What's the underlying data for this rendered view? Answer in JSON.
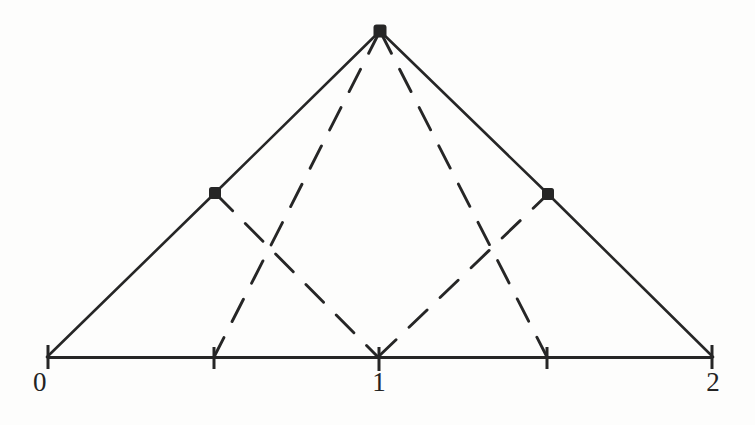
{
  "figure": {
    "title": "",
    "background_color": "#fdfdfc",
    "ink_color": "#262626"
  },
  "axis": {
    "name": "horizontal-number-line",
    "y_pixel": 357,
    "x_start_pixel": 47,
    "x_end_pixel": 713,
    "domain": [
      0,
      2
    ],
    "labels": [
      {
        "text": "0",
        "value": 0,
        "x_pixel": 47,
        "shown": true
      },
      {
        "text": "1",
        "value": 1,
        "x_pixel": 378,
        "shown": true
      },
      {
        "text": "2",
        "value": 2,
        "x_pixel": 713,
        "shown": true
      }
    ],
    "ticks": [
      {
        "value": 0,
        "x_pixel": 47,
        "labeled": true
      },
      {
        "value": 0.5,
        "x_pixel": 214,
        "labeled": false
      },
      {
        "value": 1,
        "x_pixel": 378,
        "labeled": true
      },
      {
        "value": 1.5,
        "x_pixel": 547,
        "labeled": false
      },
      {
        "value": 2,
        "x_pixel": 713,
        "labeled": true
      }
    ]
  },
  "chart_data": {
    "type": "line",
    "title": "",
    "xlabel": "",
    "ylabel": "",
    "xlim": [
      0,
      2
    ],
    "ylim": [
      0,
      1
    ],
    "grid": false,
    "legend": null,
    "x_tick_values": [
      0,
      0.5,
      1,
      1.5,
      2
    ],
    "x_tick_labels": [
      "0",
      "",
      "1",
      "",
      "2"
    ],
    "series": [
      {
        "name": "solid-hat-function",
        "style": "solid",
        "color": "#262626",
        "x": [
          0,
          0.5,
          1,
          1.5,
          2
        ],
        "y": [
          0,
          0.5,
          1,
          0.5,
          0
        ],
        "points_px": [
          [
            47,
            357
          ],
          [
            215,
            193
          ],
          [
            380,
            31
          ],
          [
            548,
            194
          ],
          [
            713,
            357
          ]
        ]
      },
      {
        "name": "dashed-hat-left",
        "style": "dashed",
        "color": "#262626",
        "x": [
          0.5,
          1
        ],
        "y": [
          1,
          0
        ],
        "points_px": [
          [
            380,
            31
          ],
          [
            214,
            357
          ]
        ]
      },
      {
        "name": "dashed-hat-right",
        "style": "dashed",
        "color": "#262626",
        "x": [
          1,
          1.5
        ],
        "y": [
          0,
          1
        ],
        "points_px": [
          [
            380,
            31
          ],
          [
            547,
            357
          ]
        ]
      },
      {
        "name": "dashed-descend-left",
        "style": "dashed",
        "color": "#262626",
        "x": [
          0.5,
          1
        ],
        "y": [
          0.5,
          0
        ],
        "points_px": [
          [
            215,
            193
          ],
          [
            378,
            357
          ]
        ]
      },
      {
        "name": "dashed-descend-right",
        "style": "dashed",
        "color": "#262626",
        "x": [
          1,
          1.5
        ],
        "y": [
          0,
          0.5
        ],
        "points_px": [
          [
            378,
            357
          ],
          [
            548,
            194
          ]
        ]
      }
    ],
    "markers": [
      {
        "name": "node-left",
        "x": 0.5,
        "y": 0.5,
        "x_pixel": 215,
        "y_pixel": 193,
        "shape": "filled-square-dot"
      },
      {
        "name": "node-apex",
        "x": 1.0,
        "y": 1.0,
        "x_pixel": 380,
        "y_pixel": 31,
        "shape": "filled-square-dot"
      },
      {
        "name": "node-right",
        "x": 1.5,
        "y": 0.5,
        "x_pixel": 548,
        "y_pixel": 194,
        "shape": "filled-square-dot"
      }
    ]
  }
}
